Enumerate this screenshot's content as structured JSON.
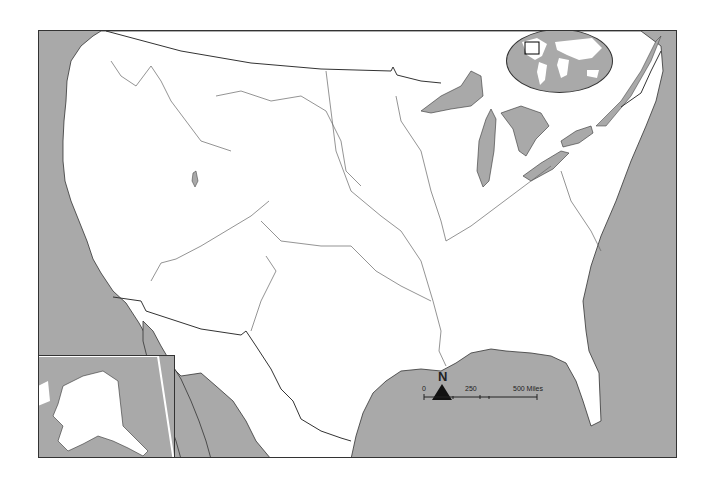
{
  "map": {
    "title": "United States outline map with major rivers",
    "colors": {
      "water": "#a9a9a9",
      "land": "#ffffff",
      "border": "#333333",
      "river": "#666666"
    }
  },
  "north_arrow": {
    "label": "N"
  },
  "scale_bar": {
    "ticks": [
      "0",
      "250",
      "500 Miles"
    ]
  },
  "inset_world": {
    "description": "World locator globe with box over North America"
  },
  "inset_alaska": {
    "description": "Alaska inset"
  }
}
